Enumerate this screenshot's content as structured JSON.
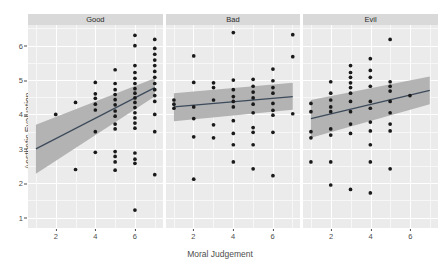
{
  "chart_data": {
    "type": "scatter",
    "title": "",
    "xlabel": "Moral Judgement",
    "ylabel": "Aesthetic Evaluation",
    "xlim": [
      0.6,
      7.4
    ],
    "ylim": [
      0.7,
      6.6
    ],
    "xticks": [
      2,
      4,
      6
    ],
    "yticks": [
      1,
      2,
      3,
      4,
      5,
      6
    ],
    "grid": true,
    "legend": "none",
    "facet_variable": "Moral Character",
    "facets": [
      {
        "label": "Good",
        "fit": {
          "type": "linear",
          "x": [
            1,
            7
          ],
          "y": [
            3.0,
            4.78
          ],
          "ci_lower": [
            2.28,
            4.52
          ],
          "ci_upper": [
            3.7,
            5.05
          ],
          "slope": 0.297,
          "intercept": 2.7
        },
        "points": [
          {
            "x": 2,
            "y": 4.0
          },
          {
            "x": 3,
            "y": 4.35
          },
          {
            "x": 3,
            "y": 2.4
          },
          {
            "x": 4,
            "y": 4.93
          },
          {
            "x": 4,
            "y": 4.6
          },
          {
            "x": 4,
            "y": 4.47
          },
          {
            "x": 4,
            "y": 4.3
          },
          {
            "x": 4,
            "y": 4.13
          },
          {
            "x": 4,
            "y": 3.5
          },
          {
            "x": 4,
            "y": 2.9
          },
          {
            "x": 5,
            "y": 5.3
          },
          {
            "x": 5,
            "y": 4.9
          },
          {
            "x": 5,
            "y": 4.72
          },
          {
            "x": 5,
            "y": 4.58
          },
          {
            "x": 5,
            "y": 4.43
          },
          {
            "x": 5,
            "y": 4.28
          },
          {
            "x": 5,
            "y": 4.1
          },
          {
            "x": 5,
            "y": 3.95
          },
          {
            "x": 5,
            "y": 3.72
          },
          {
            "x": 5,
            "y": 3.58
          },
          {
            "x": 5,
            "y": 2.92
          },
          {
            "x": 5,
            "y": 2.78
          },
          {
            "x": 5,
            "y": 2.62
          },
          {
            "x": 5,
            "y": 2.38
          },
          {
            "x": 6,
            "y": 6.3
          },
          {
            "x": 6,
            "y": 6.0
          },
          {
            "x": 6,
            "y": 5.42
          },
          {
            "x": 6,
            "y": 5.22
          },
          {
            "x": 6,
            "y": 5.05
          },
          {
            "x": 6,
            "y": 4.9
          },
          {
            "x": 6,
            "y": 4.75
          },
          {
            "x": 6,
            "y": 4.62
          },
          {
            "x": 6,
            "y": 4.48
          },
          {
            "x": 6,
            "y": 4.35
          },
          {
            "x": 6,
            "y": 4.2
          },
          {
            "x": 6,
            "y": 4.05
          },
          {
            "x": 6,
            "y": 3.9
          },
          {
            "x": 6,
            "y": 3.75
          },
          {
            "x": 6,
            "y": 3.6
          },
          {
            "x": 6,
            "y": 2.88
          },
          {
            "x": 6,
            "y": 2.7
          },
          {
            "x": 6,
            "y": 2.58
          },
          {
            "x": 6,
            "y": 1.22
          },
          {
            "x": 7,
            "y": 6.18
          },
          {
            "x": 7,
            "y": 5.92
          },
          {
            "x": 7,
            "y": 5.75
          },
          {
            "x": 7,
            "y": 5.58
          },
          {
            "x": 7,
            "y": 5.42
          },
          {
            "x": 7,
            "y": 5.25
          },
          {
            "x": 7,
            "y": 5.08
          },
          {
            "x": 7,
            "y": 4.9
          },
          {
            "x": 7,
            "y": 4.72
          },
          {
            "x": 7,
            "y": 4.55
          },
          {
            "x": 7,
            "y": 4.38
          },
          {
            "x": 7,
            "y": 4.0
          },
          {
            "x": 7,
            "y": 3.5
          },
          {
            "x": 7,
            "y": 2.25
          }
        ]
      },
      {
        "label": "Bad",
        "fit": {
          "type": "linear",
          "x": [
            1,
            7
          ],
          "y": [
            4.22,
            4.52
          ],
          "ci_lower": [
            3.8,
            4.14
          ],
          "ci_upper": [
            4.62,
            4.92
          ],
          "slope": 0.05,
          "intercept": 4.17
        },
        "points": [
          {
            "x": 1,
            "y": 4.42
          },
          {
            "x": 1,
            "y": 4.3
          },
          {
            "x": 1,
            "y": 4.18
          },
          {
            "x": 2,
            "y": 5.7
          },
          {
            "x": 2,
            "y": 4.93
          },
          {
            "x": 2,
            "y": 4.22
          },
          {
            "x": 2,
            "y": 3.88
          },
          {
            "x": 2,
            "y": 3.35
          },
          {
            "x": 2,
            "y": 2.12
          },
          {
            "x": 3,
            "y": 4.92
          },
          {
            "x": 3,
            "y": 4.78
          },
          {
            "x": 3,
            "y": 4.42
          },
          {
            "x": 3,
            "y": 3.7
          },
          {
            "x": 3,
            "y": 3.32
          },
          {
            "x": 4,
            "y": 6.38
          },
          {
            "x": 4,
            "y": 5.0
          },
          {
            "x": 4,
            "y": 4.72
          },
          {
            "x": 4,
            "y": 4.52
          },
          {
            "x": 4,
            "y": 4.38
          },
          {
            "x": 4,
            "y": 4.22
          },
          {
            "x": 4,
            "y": 3.82
          },
          {
            "x": 4,
            "y": 3.45
          },
          {
            "x": 4,
            "y": 3.12
          },
          {
            "x": 4,
            "y": 2.62
          },
          {
            "x": 5,
            "y": 5.02
          },
          {
            "x": 5,
            "y": 4.82
          },
          {
            "x": 5,
            "y": 4.65
          },
          {
            "x": 5,
            "y": 4.48
          },
          {
            "x": 5,
            "y": 4.3
          },
          {
            "x": 5,
            "y": 4.05
          },
          {
            "x": 5,
            "y": 3.62
          },
          {
            "x": 5,
            "y": 3.48
          },
          {
            "x": 5,
            "y": 3.12
          },
          {
            "x": 5,
            "y": 2.42
          },
          {
            "x": 6,
            "y": 5.32
          },
          {
            "x": 6,
            "y": 4.98
          },
          {
            "x": 6,
            "y": 4.78
          },
          {
            "x": 6,
            "y": 4.62
          },
          {
            "x": 6,
            "y": 4.32
          },
          {
            "x": 6,
            "y": 4.12
          },
          {
            "x": 6,
            "y": 3.98
          },
          {
            "x": 6,
            "y": 3.48
          },
          {
            "x": 6,
            "y": 2.22
          },
          {
            "x": 7,
            "y": 6.32
          },
          {
            "x": 7,
            "y": 5.68
          },
          {
            "x": 7,
            "y": 4.02
          }
        ]
      },
      {
        "label": "Evil",
        "fit": {
          "type": "linear",
          "x": [
            1,
            7
          ],
          "y": [
            3.88,
            4.7
          ],
          "ci_lower": [
            3.32,
            4.3
          ],
          "ci_upper": [
            4.42,
            5.1
          ],
          "slope": 0.137,
          "intercept": 3.74
        },
        "points": [
          {
            "x": 1,
            "y": 4.32
          },
          {
            "x": 1,
            "y": 4.08
          },
          {
            "x": 1,
            "y": 3.5
          },
          {
            "x": 1,
            "y": 3.32
          },
          {
            "x": 1,
            "y": 2.62
          },
          {
            "x": 2,
            "y": 4.95
          },
          {
            "x": 2,
            "y": 4.62
          },
          {
            "x": 2,
            "y": 4.42
          },
          {
            "x": 2,
            "y": 4.22
          },
          {
            "x": 2,
            "y": 4.08
          },
          {
            "x": 2,
            "y": 3.58
          },
          {
            "x": 2,
            "y": 3.4
          },
          {
            "x": 2,
            "y": 2.62
          },
          {
            "x": 2,
            "y": 1.95
          },
          {
            "x": 3,
            "y": 5.42
          },
          {
            "x": 3,
            "y": 5.22
          },
          {
            "x": 3,
            "y": 5.08
          },
          {
            "x": 3,
            "y": 4.92
          },
          {
            "x": 3,
            "y": 4.78
          },
          {
            "x": 3,
            "y": 4.62
          },
          {
            "x": 3,
            "y": 4.38
          },
          {
            "x": 3,
            "y": 4.08
          },
          {
            "x": 3,
            "y": 3.72
          },
          {
            "x": 3,
            "y": 3.45
          },
          {
            "x": 3,
            "y": 1.82
          },
          {
            "x": 4,
            "y": 5.62
          },
          {
            "x": 4,
            "y": 5.28
          },
          {
            "x": 4,
            "y": 5.08
          },
          {
            "x": 4,
            "y": 4.82
          },
          {
            "x": 4,
            "y": 4.38
          },
          {
            "x": 4,
            "y": 4.18
          },
          {
            "x": 4,
            "y": 3.78
          },
          {
            "x": 4,
            "y": 3.52
          },
          {
            "x": 4,
            "y": 3.12
          },
          {
            "x": 4,
            "y": 2.62
          },
          {
            "x": 4,
            "y": 1.72
          },
          {
            "x": 5,
            "y": 6.18
          },
          {
            "x": 5,
            "y": 4.95
          },
          {
            "x": 5,
            "y": 4.82
          },
          {
            "x": 5,
            "y": 4.68
          },
          {
            "x": 5,
            "y": 4.38
          },
          {
            "x": 5,
            "y": 4.05
          },
          {
            "x": 5,
            "y": 3.72
          },
          {
            "x": 5,
            "y": 3.52
          },
          {
            "x": 5,
            "y": 2.42
          },
          {
            "x": 6,
            "y": 4.55
          }
        ]
      }
    ]
  },
  "axis": {
    "y_title": "Aesthetic Evaluation",
    "x_title": "Moral Judgement",
    "y_tick_labels": [
      "6",
      "5",
      "4",
      "3",
      "2",
      "1"
    ],
    "x_tick_labels": [
      "2",
      "4",
      "6"
    ]
  },
  "strips": {
    "good": "Good",
    "bad": "Bad",
    "evil": "Evil"
  },
  "style": {
    "panel_bg": "#ebebeb",
    "strip_bg": "#d9d9d9",
    "grid_major": "#ffffff",
    "point_color": "#1a1a1a",
    "line_color": "#3c4a5a",
    "ribbon_color": "#b3b3b3",
    "text_color": "#4d4d4d"
  }
}
